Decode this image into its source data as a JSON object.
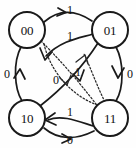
{
  "diagram": {
    "type": "state-transition-diagram",
    "title": "",
    "width": 136,
    "height": 148,
    "background_color": "#fefefe",
    "ink_color": "#1a1a1a",
    "nodes": [
      {
        "id": "s00",
        "label": "00",
        "x": 27,
        "y": 30,
        "r": 18
      },
      {
        "id": "s01",
        "label": "01",
        "x": 110,
        "y": 30,
        "r": 18
      },
      {
        "id": "s10",
        "label": "10",
        "x": 27,
        "y": 118,
        "r": 18
      },
      {
        "id": "s11",
        "label": "11",
        "x": 110,
        "y": 118,
        "r": 18
      }
    ],
    "edges": [
      {
        "id": "e-00-01",
        "from": "s00",
        "to": "s01",
        "label": "1",
        "style": "solid",
        "label_x": 70,
        "label_y": 10
      },
      {
        "id": "e-01-00",
        "from": "s01",
        "to": "s00",
        "label": "1",
        "style": "solid",
        "label_x": 70,
        "label_y": 36
      },
      {
        "id": "e-10-00",
        "from": "s10",
        "to": "s00",
        "label": "0",
        "style": "solid",
        "label_x": 7,
        "label_y": 74
      },
      {
        "id": "e-01-11",
        "from": "s01",
        "to": "s11",
        "label": "0",
        "style": "solid",
        "label_x": 130,
        "label_y": 74
      },
      {
        "id": "e-11-10",
        "from": "s11",
        "to": "s10",
        "label": "1",
        "style": "solid",
        "label_x": 70,
        "label_y": 112
      },
      {
        "id": "e-10-11",
        "from": "s10",
        "to": "s11",
        "label": "0",
        "style": "solid",
        "label_x": 70,
        "label_y": 140
      },
      {
        "id": "e-10-01",
        "from": "s10",
        "to": "s01",
        "label": "1",
        "style": "solid",
        "label_x": 78,
        "label_y": 72
      },
      {
        "id": "e-00-11",
        "from": "s00",
        "to": "s11",
        "label": "0",
        "style": "dotted",
        "label_x": 56,
        "label_y": 80
      }
    ],
    "legend": {
      "solid_meaning": "",
      "dotted_meaning": ""
    },
    "edge_labels_all": [
      "1",
      "1",
      "0",
      "0",
      "1",
      "0",
      "1",
      "0"
    ],
    "node_labels_all": [
      "00",
      "01",
      "10",
      "11"
    ]
  }
}
